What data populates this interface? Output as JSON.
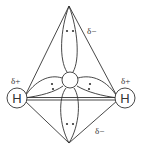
{
  "diagram": {
    "atoms": [
      {
        "id": "left-hydrogen",
        "label": "H",
        "charge": "δ+"
      },
      {
        "id": "right-hydrogen",
        "label": "H",
        "charge": "δ+"
      },
      {
        "id": "oxygen",
        "label": ""
      }
    ],
    "lone_pair_charges": [
      "δ−",
      "δ−"
    ],
    "labels": {
      "h_left": "H",
      "h_right": "H",
      "delta_plus_left": "δ+",
      "delta_plus_right": "δ+",
      "delta_minus_top": "δ−",
      "delta_minus_bottom": "δ−"
    },
    "colors": {
      "stroke": "#333333",
      "background": "#ffffff"
    }
  }
}
